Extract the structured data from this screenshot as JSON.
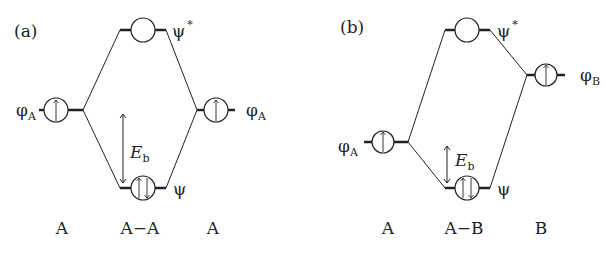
{
  "figure": {
    "panels": [
      {
        "id": "a",
        "label": "(a)",
        "left_orbital": {
          "symbol": "φ",
          "subscript": "A",
          "electrons": "↑"
        },
        "right_orbital": {
          "symbol": "φ",
          "subscript": "A",
          "electrons": "↑"
        },
        "antibonding": {
          "symbol": "ψ",
          "superscript": "*",
          "electrons": ""
        },
        "bonding": {
          "symbol": "ψ",
          "electrons": "↑↓"
        },
        "energy_label": {
          "symbol": "E",
          "subscript": "b"
        },
        "bottom_labels": [
          "A",
          "A−A",
          "A"
        ]
      },
      {
        "id": "b",
        "label": "(b)",
        "left_orbital": {
          "symbol": "φ",
          "subscript": "A",
          "electrons": "↑"
        },
        "right_orbital": {
          "symbol": "φ",
          "subscript": "B",
          "electrons": "↑"
        },
        "antibonding": {
          "symbol": "ψ",
          "superscript": "*",
          "electrons": ""
        },
        "bonding": {
          "symbol": "ψ",
          "electrons": "↑↓"
        },
        "energy_label": {
          "symbol": "E",
          "subscript": "b"
        },
        "bottom_labels": [
          "A",
          "A−B",
          "B"
        ]
      }
    ],
    "line_color": "#222222",
    "background": "#ffffff"
  }
}
